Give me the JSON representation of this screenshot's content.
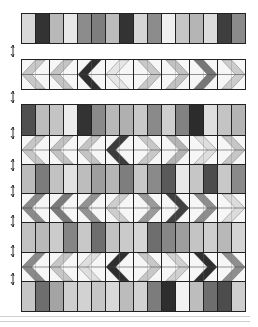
{
  "diagram": {
    "palette": {
      "white": "#f4f4f4",
      "light": "#d6d6d6",
      "mid_light": "#b9b9b9",
      "mid": "#8e8e8e",
      "dark": "#555555",
      "black": "#2e2e2e"
    },
    "top_strip": {
      "bars": [
        "#d8d8d8",
        "#333333",
        "#b8b8b8",
        "#e8e8e8",
        "#8c8c8c",
        "#7e7e7e",
        "#bcbcbc",
        "#333333",
        "#d6d6d6",
        "#8c8c8c",
        "#f0f0f0",
        "#c6c6c6",
        "#b5b5b5",
        "#dcdcdc",
        "#3e3e3e",
        "#8a8a8a"
      ]
    },
    "chevron_strip": {
      "blocks": [
        {
          "dir": "left",
          "color": "#c8c8c8"
        },
        {
          "dir": "left",
          "color": "#c4c4c4"
        },
        {
          "dir": "left",
          "color": "#2e2e2e"
        },
        {
          "dir": "left",
          "color": "#e6e6e6"
        },
        {
          "dir": "right",
          "color": "#c8c8c8"
        },
        {
          "dir": "right",
          "color": "#c2c2c2"
        },
        {
          "dir": "right",
          "color": "#777777"
        },
        {
          "dir": "right",
          "color": "#cccccc"
        }
      ]
    },
    "quilt": {
      "bar_rows": [
        [
          "#505050",
          "#bcbcbc",
          "#c4c4c4",
          "#ececec",
          "#333333",
          "#8a8a8a",
          "#b8b8b8",
          "#b0b0b0",
          "#c9c9c9",
          "#8a8a8a",
          "#cfcfcf",
          "#828282",
          "#2c2c2c",
          "#dedede",
          "#c4c4c4",
          "#b4b4b4"
        ],
        [
          "#bcbcbc",
          "#7c7c7c",
          "#c2c2c2",
          "#e2e2e2",
          "#bdbdbd",
          "#9e9e9e",
          "#b6b6b6",
          "#7e7e7e",
          "#c8c8c8",
          "#8a8a8a",
          "#5a5a5a",
          "#e8e8e8",
          "#c6c6c6",
          "#4c4c4c",
          "#c8c8c8",
          "#8a8a8a"
        ],
        [
          "#c2c2c2",
          "#b9b9b9",
          "#cbcbcb",
          "#858585",
          "#c8c8c8",
          "#6e6e6e",
          "#c2c2c2",
          "#cacaca",
          "#d6d6d6",
          "#6e6e6e",
          "#878787",
          "#9e9e9e",
          "#c4c4c4",
          "#cfcfcf",
          "#b8b8b8",
          "#d4d4d4"
        ],
        [
          "#c6c6c6",
          "#6e6e6e",
          "#a4a4a4",
          "#cfcfcf",
          "#d2d2d2",
          "#c6c6c6",
          "#d8d8d8",
          "#bcbcbc",
          "#d2d2d2",
          "#7c7c7c",
          "#2e2e2e",
          "#f2f2f2",
          "#bdbdbd",
          "#6e6e6e",
          "#4c4c4c",
          "#cecece"
        ]
      ],
      "chevron_rows": [
        [
          {
            "dir": "left",
            "color": "#c6c6c6"
          },
          {
            "dir": "left",
            "color": "#c2c2c2"
          },
          {
            "dir": "left",
            "color": "#c4c4c4"
          },
          {
            "dir": "left",
            "color": "#3c3c3c"
          },
          {
            "dir": "right",
            "color": "#c8c8c8"
          },
          {
            "dir": "right",
            "color": "#b4b4b4"
          },
          {
            "dir": "right",
            "color": "#dedede"
          },
          {
            "dir": "right",
            "color": "#c6c6c6"
          }
        ],
        [
          {
            "dir": "left",
            "color": "#8a8a8a"
          },
          {
            "dir": "left",
            "color": "#7a7a7a"
          },
          {
            "dir": "left",
            "color": "#929292"
          },
          {
            "dir": "left",
            "color": "#cdcdcd"
          },
          {
            "dir": "right",
            "color": "#9a9a9a"
          },
          {
            "dir": "right",
            "color": "#404040"
          },
          {
            "dir": "right",
            "color": "#8e8e8e"
          },
          {
            "dir": "right",
            "color": "#dcdcdc"
          }
        ],
        [
          {
            "dir": "left",
            "color": "#8a8a8a"
          },
          {
            "dir": "left",
            "color": "#c6c6c6"
          },
          {
            "dir": "left",
            "color": "#dedede"
          },
          {
            "dir": "left",
            "color": "#2e2e2e"
          },
          {
            "dir": "right",
            "color": "#c8c8c8"
          },
          {
            "dir": "right",
            "color": "#d0d0d0"
          },
          {
            "dir": "right",
            "color": "#2e2e2e"
          },
          {
            "dir": "right",
            "color": "#8e8e8e"
          }
        ]
      ]
    },
    "side_arrows": 8
  }
}
